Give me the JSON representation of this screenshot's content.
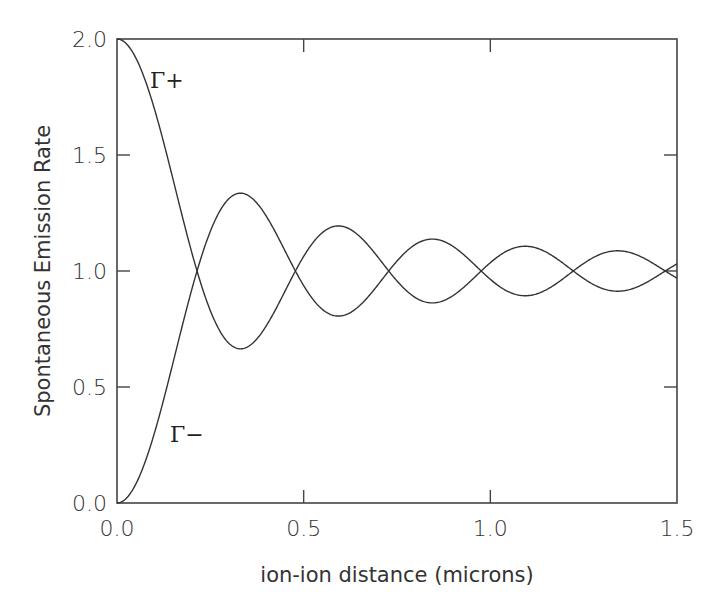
{
  "chart_data": {
    "type": "line",
    "title": "",
    "xlabel": "ion-ion distance (microns)",
    "ylabel": "Spontaneous Emission Rate",
    "xlim": [
      0.0,
      1.5
    ],
    "ylim": [
      0.0,
      2.0
    ],
    "grid": false,
    "legend": "none (inline curve labels)",
    "x_ticks": [
      0.0,
      0.5,
      1.0,
      1.5
    ],
    "x_tick_labels": [
      "0.0",
      "0.5",
      "1.0",
      "1.5"
    ],
    "y_ticks": [
      0.0,
      0.5,
      1.0,
      1.5,
      2.0
    ],
    "y_tick_labels": [
      "0.0",
      "0.5",
      "1.0",
      "1.5",
      "2.0"
    ],
    "annotations": [
      {
        "text": "Γ+",
        "x": 0.13,
        "y": 1.8,
        "series": "Gamma_plus"
      },
      {
        "text": "Γ−",
        "x": 0.14,
        "y": 0.3,
        "series": "Gamma_minus"
      }
    ],
    "x": [
      0.0,
      0.05,
      0.1,
      0.15,
      0.2,
      0.25,
      0.3,
      0.35,
      0.4,
      0.45,
      0.5,
      0.55,
      0.6,
      0.65,
      0.7,
      0.75,
      0.8,
      0.85,
      0.9,
      0.95,
      1.0,
      1.05,
      1.1,
      1.15,
      1.2,
      1.25,
      1.3,
      1.35,
      1.4,
      1.45,
      1.5
    ],
    "series": [
      {
        "name": "Γ+",
        "values": [
          2.0,
          1.92,
          1.7,
          1.4,
          1.08,
          0.83,
          0.69,
          0.67,
          0.76,
          0.91,
          1.06,
          1.16,
          1.19,
          1.15,
          1.06,
          0.96,
          0.88,
          0.86,
          0.89,
          0.96,
          1.04,
          1.09,
          1.11,
          1.08,
          1.03,
          0.97,
          0.92,
          0.91,
          0.93,
          0.98,
          1.03
        ]
      },
      {
        "name": "Γ−",
        "values": [
          0.0,
          0.08,
          0.3,
          0.6,
          0.92,
          1.17,
          1.31,
          1.33,
          1.24,
          1.09,
          0.94,
          0.84,
          0.81,
          0.85,
          0.94,
          1.04,
          1.12,
          1.14,
          1.11,
          1.04,
          0.96,
          0.91,
          0.89,
          0.92,
          0.97,
          1.03,
          1.08,
          1.09,
          1.07,
          1.02,
          0.97
        ]
      }
    ],
    "model": {
      "description": "Gamma± = 1 ± (3/2)[sin(kr)/(kr) + cos(kr)/(kr)^2 − sin(kr)/(kr)^3]",
      "k_per_micron": 12.8
    }
  },
  "plot_area": {
    "left": 117,
    "top": 39,
    "right": 677,
    "bottom": 503
  }
}
